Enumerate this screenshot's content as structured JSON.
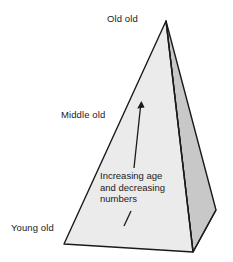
{
  "figure": {
    "type": "diagram",
    "background_color": "#ffffff",
    "shape": {
      "name": "three-dimensional-pyramid",
      "front_face_color": "#ebebeb",
      "side_face_color": "#c8c8c8",
      "outline_color": "#1a1a1a",
      "vertices": {
        "apex": [
          166,
          21
        ],
        "front_left_base": [
          64,
          244
        ],
        "front_bottom_base": [
          193,
          252
        ],
        "right_base": [
          216,
          210
        ]
      }
    },
    "labels": {
      "top": "Old old",
      "middle": "Middle old",
      "bottom": "Young old"
    },
    "annotation": {
      "lines": [
        "Increasing age",
        "and decreasing",
        "numbers"
      ],
      "arrow": {
        "name": "upward-arrow",
        "direction": "up-right",
        "tail": [
          134,
          168
        ],
        "head": [
          141,
          103
        ]
      },
      "tick": {
        "name": "arrow-tail-tick",
        "from": [
          124,
          226
        ],
        "to": [
          131,
          212
        ]
      }
    }
  }
}
